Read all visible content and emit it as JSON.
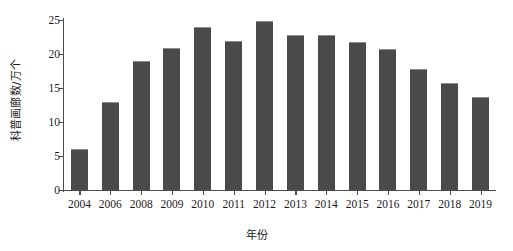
{
  "chart_data": {
    "type": "bar",
    "title": "",
    "xlabel": "年份",
    "ylabel": "科普画廊数/万个",
    "categories": [
      "2004",
      "2006",
      "2008",
      "2009",
      "2010",
      "2011",
      "2012",
      "2013",
      "2014",
      "2015",
      "2016",
      "2017",
      "2018",
      "2019"
    ],
    "values": [
      6.0,
      12.9,
      19.0,
      20.9,
      23.9,
      21.9,
      24.8,
      22.8,
      22.8,
      21.8,
      20.7,
      17.8,
      15.7,
      13.7
    ],
    "ylim": [
      0,
      25
    ],
    "yticks": [
      0,
      5,
      10,
      15,
      20,
      25
    ],
    "ytick_labels": [
      "0",
      "5",
      "10",
      "15",
      "20",
      "25"
    ],
    "grid": false,
    "legend": false,
    "bar_color": "#4a4a4a",
    "axis_color": "#4d4d4d"
  }
}
